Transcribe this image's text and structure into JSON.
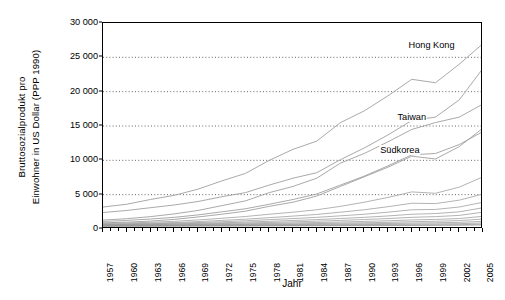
{
  "chart_data": {
    "type": "line",
    "title": "",
    "xlabel": "Jahr",
    "ylabel_line1": "Bruttosozialprodukt pro",
    "ylabel_line2": "Einwohner in US Dollar (PPP 1990)",
    "xlim": [
      1957,
      2005
    ],
    "ylim": [
      0,
      30000
    ],
    "ytick_values": [
      0,
      5000,
      10000,
      15000,
      20000,
      25000,
      30000
    ],
    "ytick_labels": [
      "0",
      "5 000",
      "10 000",
      "15 000",
      "20 000",
      "25 000",
      "30 000"
    ],
    "xtick_labels": [
      "1957",
      "1960",
      "1963",
      "1966",
      "1969",
      "1972",
      "1975",
      "1978",
      "1981",
      "1984",
      "1987",
      "1990",
      "1993",
      "1996",
      "1999",
      "2002",
      "2005"
    ],
    "xtick_step_years": 3,
    "minor_ticks_every_year": true,
    "grid": "horizontal-dotted",
    "legend_position": "inline-annotations",
    "line_color": "#9a9a9a",
    "axis_color": "#000000",
    "grid_color": "#555555",
    "annotations": [
      {
        "label": "Hong Kong",
        "x": 1998.5,
        "y": 26600
      },
      {
        "label": "Taiwan",
        "x": 1996.0,
        "y": 16200
      },
      {
        "label": "Südkorea",
        "x": 1994.5,
        "y": 11300
      }
    ],
    "series": [
      {
        "name": "Hong Kong",
        "x": [
          1957,
          1960,
          1963,
          1966,
          1969,
          1972,
          1975,
          1978,
          1981,
          1984,
          1987,
          1990,
          1993,
          1996,
          1999,
          2002,
          2005
        ],
        "values": [
          3200,
          3600,
          4300,
          4900,
          5800,
          7000,
          8100,
          10000,
          11600,
          12800,
          15500,
          17200,
          19400,
          21800,
          21300,
          24000,
          27000
        ]
      },
      {
        "name": "Series-2",
        "x": [
          1957,
          1960,
          1963,
          1966,
          1969,
          1972,
          1975,
          1978,
          1981,
          1984,
          1987,
          1990,
          1993,
          1996,
          1999,
          2002,
          2005
        ],
        "values": [
          2400,
          2700,
          3100,
          3500,
          4000,
          4700,
          5300,
          6400,
          7400,
          8200,
          10100,
          11800,
          13700,
          15800,
          16300,
          18800,
          23400
        ]
      },
      {
        "name": "Taiwan",
        "x": [
          1957,
          1960,
          1963,
          1966,
          1969,
          1972,
          1975,
          1978,
          1981,
          1984,
          1987,
          1990,
          1993,
          1996,
          1999,
          2002,
          2005
        ],
        "values": [
          1300,
          1500,
          1800,
          2200,
          2700,
          3400,
          4100,
          5300,
          6200,
          7400,
          9600,
          11000,
          12700,
          14500,
          15500,
          16300,
          18200
        ]
      },
      {
        "name": "Series-4",
        "x": [
          1957,
          1960,
          1963,
          1966,
          1969,
          1972,
          1975,
          1978,
          1981,
          1984,
          1987,
          1990,
          1993,
          1996,
          1999,
          2002,
          2005
        ],
        "values": [
          1100,
          1250,
          1450,
          1700,
          2050,
          2500,
          2950,
          3600,
          4300,
          5100,
          6400,
          7700,
          9200,
          10800,
          11000,
          12300,
          14200
        ]
      },
      {
        "name": "Südkorea",
        "x": [
          1957,
          1960,
          1963,
          1966,
          1969,
          1972,
          1975,
          1978,
          1981,
          1984,
          1987,
          1990,
          1993,
          1996,
          1999,
          2002,
          2005
        ],
        "values": [
          900,
          1000,
          1150,
          1400,
          1750,
          2150,
          2600,
          3300,
          3900,
          4800,
          6200,
          7600,
          9000,
          10600,
          10200,
          12000,
          14700
        ]
      },
      {
        "name": "Series-6",
        "x": [
          1957,
          1960,
          1963,
          1966,
          1969,
          1972,
          1975,
          1978,
          1981,
          1984,
          1987,
          1990,
          1993,
          1996,
          1999,
          2002,
          2005
        ],
        "values": [
          800,
          880,
          980,
          1120,
          1320,
          1560,
          1820,
          2150,
          2450,
          2800,
          3300,
          3900,
          4600,
          5400,
          5200,
          6100,
          7600
        ]
      },
      {
        "name": "Series-7",
        "x": [
          1957,
          1960,
          1963,
          1966,
          1969,
          1972,
          1975,
          1978,
          1981,
          1984,
          1987,
          1990,
          1993,
          1996,
          1999,
          2002,
          2005
        ],
        "values": [
          700,
          760,
          840,
          940,
          1080,
          1250,
          1430,
          1650,
          1880,
          2120,
          2450,
          2800,
          3250,
          3750,
          3700,
          4200,
          5100
        ]
      },
      {
        "name": "Series-8",
        "x": [
          1957,
          1960,
          1963,
          1966,
          1969,
          1972,
          1975,
          1978,
          1981,
          1984,
          1987,
          1990,
          1993,
          1996,
          1999,
          2002,
          2005
        ],
        "values": [
          650,
          700,
          760,
          840,
          940,
          1060,
          1200,
          1360,
          1520,
          1700,
          1920,
          2150,
          2450,
          2800,
          2850,
          3200,
          3900
        ]
      },
      {
        "name": "Series-9",
        "x": [
          1957,
          1960,
          1963,
          1966,
          1969,
          1972,
          1975,
          1978,
          1981,
          1984,
          1987,
          1990,
          1993,
          1996,
          1999,
          2002,
          2005
        ],
        "values": [
          600,
          640,
          690,
          750,
          820,
          910,
          1010,
          1120,
          1240,
          1370,
          1530,
          1700,
          1900,
          2150,
          2250,
          2500,
          3100
        ]
      },
      {
        "name": "Series-10",
        "x": [
          1957,
          1960,
          1963,
          1966,
          1969,
          1972,
          1975,
          1978,
          1981,
          1984,
          1987,
          1990,
          1993,
          1996,
          1999,
          2002,
          2005
        ],
        "values": [
          560,
          590,
          630,
          680,
          730,
          800,
          870,
          950,
          1040,
          1140,
          1250,
          1380,
          1520,
          1700,
          1800,
          1980,
          2450
        ]
      },
      {
        "name": "Series-11",
        "x": [
          1957,
          1960,
          1963,
          1966,
          1969,
          1972,
          1975,
          1978,
          1981,
          1984,
          1987,
          1990,
          1993,
          1996,
          1999,
          2002,
          2005
        ],
        "values": [
          520,
          545,
          575,
          610,
          650,
          700,
          750,
          810,
          875,
          945,
          1020,
          1105,
          1200,
          1320,
          1400,
          1520,
          1850
        ]
      },
      {
        "name": "Series-12",
        "x": [
          1957,
          1960,
          1963,
          1966,
          1969,
          1972,
          1975,
          1978,
          1981,
          1984,
          1987,
          1990,
          1993,
          1996,
          1999,
          2002,
          2005
        ],
        "values": [
          490,
          510,
          535,
          560,
          590,
          625,
          660,
          700,
          745,
          795,
          850,
          910,
          975,
          1060,
          1130,
          1220,
          1450
        ]
      },
      {
        "name": "Series-13",
        "x": [
          1957,
          1960,
          1963,
          1966,
          1969,
          1972,
          1975,
          1978,
          1981,
          1984,
          1987,
          1990,
          1993,
          1996,
          1999,
          2002,
          2005
        ],
        "values": [
          470,
          485,
          500,
          520,
          540,
          565,
          590,
          620,
          650,
          685,
          720,
          760,
          805,
          860,
          910,
          970,
          1120
        ]
      },
      {
        "name": "Series-14",
        "x": [
          1957,
          1960,
          1963,
          1966,
          1969,
          1972,
          1975,
          1978,
          1981,
          1984,
          1987,
          1990,
          1993,
          1996,
          1999,
          2002,
          2005
        ],
        "values": [
          450,
          460,
          472,
          485,
          500,
          515,
          532,
          550,
          570,
          592,
          615,
          640,
          670,
          705,
          740,
          780,
          880
        ]
      },
      {
        "name": "Series-15",
        "x": [
          1957,
          1960,
          1963,
          1966,
          1969,
          1972,
          1975,
          1978,
          1981,
          1984,
          1987,
          1990,
          1993,
          1996,
          1999,
          2002,
          2005
        ],
        "values": [
          430,
          438,
          446,
          455,
          464,
          474,
          485,
          496,
          508,
          521,
          535,
          550,
          567,
          586,
          608,
          632,
          700
        ]
      },
      {
        "name": "Series-16",
        "x": [
          1957,
          1960,
          1963,
          1966,
          1969,
          1972,
          1975,
          1978,
          1981,
          1984,
          1987,
          1990,
          1993,
          1996,
          1999,
          2002,
          2005
        ],
        "values": [
          410,
          415,
          420,
          426,
          432,
          438,
          445,
          452,
          460,
          468,
          477,
          487,
          498,
          510,
          524,
          540,
          580
        ]
      }
    ]
  }
}
